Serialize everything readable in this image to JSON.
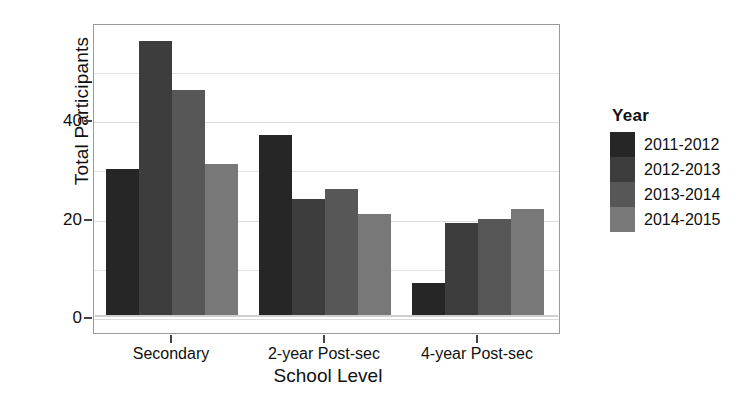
{
  "chart_data": {
    "type": "bar",
    "title": "",
    "xlabel": "School Level",
    "ylabel": "Total Participants",
    "categories": [
      "Secondary",
      "2-year Post-sec",
      "4-year Post-sec"
    ],
    "series": [
      {
        "name": "2011-2012",
        "color": "#262626",
        "values": [
          30,
          37,
          7
        ]
      },
      {
        "name": "2012-2013",
        "color": "#3d3d3d",
        "values": [
          56,
          24,
          19
        ]
      },
      {
        "name": "2013-2014",
        "color": "#575757",
        "values": [
          46,
          26,
          20
        ]
      },
      {
        "name": "2014-2015",
        "color": "#787878",
        "values": [
          31,
          21,
          22
        ]
      }
    ],
    "ylim": [
      0,
      60
    ],
    "yticks": [
      0,
      20,
      40
    ],
    "ytick_labels": [
      "0",
      "20",
      "40"
    ],
    "grid": true,
    "legend_position": "right",
    "legend_title": "Year"
  },
  "axes": {
    "y_title": "Total Participants",
    "x_title": "School Level",
    "y_ticks": [
      {
        "label": "40",
        "value": 40
      },
      {
        "label": "20",
        "value": 20
      },
      {
        "label": "0",
        "value": 0
      }
    ],
    "x_ticks": [
      {
        "label": "Secondary"
      },
      {
        "label": "2-year Post-sec"
      },
      {
        "label": "4-year Post-sec"
      }
    ]
  },
  "legend": {
    "title": "Year",
    "items": [
      {
        "label": "2011-2012",
        "color": "#262626"
      },
      {
        "label": "2012-2013",
        "color": "#3d3d3d"
      },
      {
        "label": "2013-2014",
        "color": "#575757"
      },
      {
        "label": "2014-2015",
        "color": "#787878"
      }
    ]
  },
  "style": {
    "panel_border": "#9a9a9a",
    "grid_color": "#e3e3e3",
    "background": "#ffffff",
    "text_color": "#101010"
  }
}
